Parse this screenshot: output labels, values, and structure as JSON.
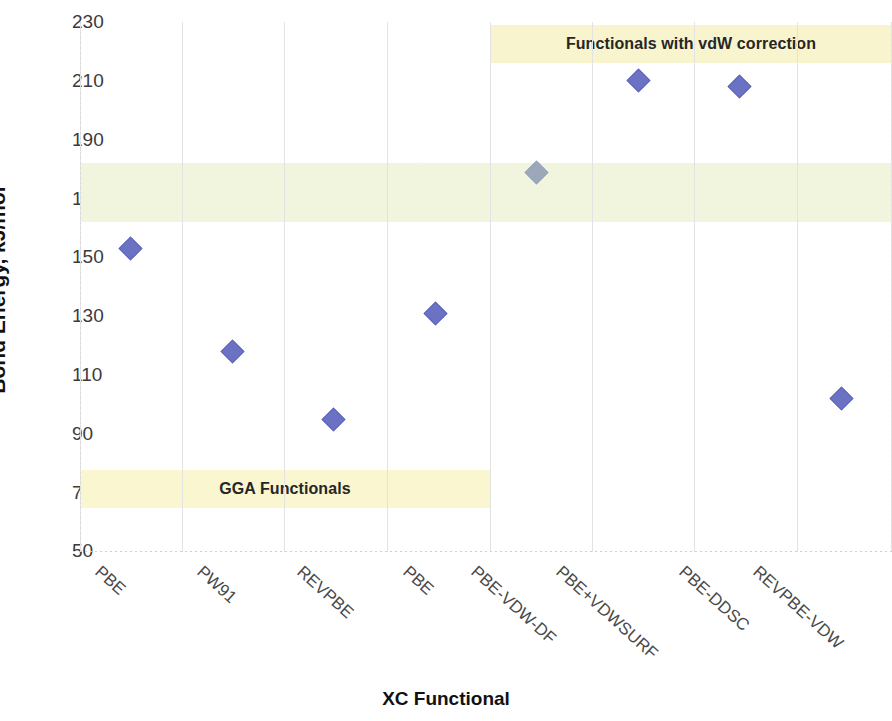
{
  "chart_data": {
    "type": "scatter",
    "title": "",
    "xlabel": "XC Functional",
    "ylabel": "Bond Energy, kJ/mol",
    "ylim": [
      50,
      230
    ],
    "ytick_step": 20,
    "yticks": [
      "230",
      "210",
      "190",
      "170",
      "150",
      "130",
      "110",
      "90",
      "70",
      "50"
    ],
    "grid": "vertical-dotted",
    "legend": "none",
    "categories": [
      "PBE",
      "PW91",
      "REVPBE",
      "PBE",
      "PBE-VDW-DF",
      "PBE+VDWSURF",
      "PBE-DDSC",
      "REVPBE-VDW"
    ],
    "series": [
      {
        "name": "Bond Energy",
        "marker": "diamond",
        "color": "#6b72c4",
        "values": [
          153,
          118,
          95,
          131,
          179,
          210,
          208,
          102
        ]
      }
    ],
    "annotations": [
      {
        "id": "gga-band",
        "text": "GGA Functionals",
        "kind": "horizontal-band",
        "color": "#f8f6d2",
        "x_from_category": "PBE",
        "x_to_category": "PBE-VDW-DF",
        "y_from": 64,
        "y_to": 77
      },
      {
        "id": "vdw-band",
        "text": "Functionals with vdW correction",
        "kind": "horizontal-band",
        "color": "#f6f2cd",
        "x_from_category": "PBE-VDW-DF",
        "x_to_category": "REVPBE-VDW",
        "y_from": 218,
        "y_to": 231
      },
      {
        "id": "experimental-band",
        "text": "",
        "kind": "horizontal-band",
        "color": "#f0f4dc",
        "y_from": 162,
        "y_to": 182
      }
    ]
  }
}
